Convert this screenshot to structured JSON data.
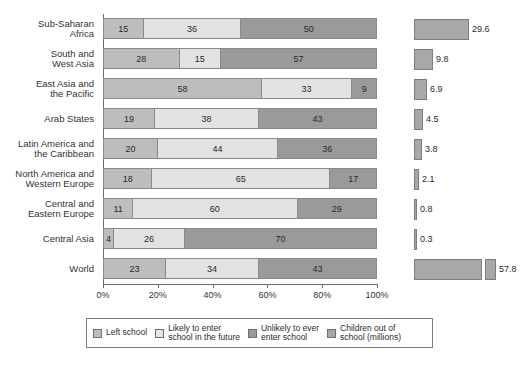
{
  "chart_data": {
    "type": "bar",
    "title": "",
    "xlabel": "",
    "ylabel": "",
    "orientation": "horizontal",
    "stacked": true,
    "stack_mode": "percent",
    "xlim": [
      0,
      100
    ],
    "xticks": [
      0,
      20,
      40,
      60,
      80,
      100
    ],
    "xtick_labels": [
      "0%",
      "20%",
      "40%",
      "60%",
      "80%",
      "100%"
    ],
    "grid": false,
    "legend_position": "bottom",
    "categories": [
      "Sub-Saharan Africa",
      "South and West Asia",
      "East Asia and the Pacific",
      "Arab States",
      "Latin America and the Caribbean",
      "North America and Western Europe",
      "Central and Eastern Europe",
      "Central Asia",
      "World"
    ],
    "series": [
      {
        "name": "Left school",
        "values": [
          15,
          28,
          58,
          19,
          20,
          18,
          11,
          4,
          23
        ]
      },
      {
        "name": "Likely to enter school in the future",
        "values": [
          36,
          15,
          33,
          38,
          44,
          65,
          60,
          26,
          34
        ]
      },
      {
        "name": "Unlikely to ever enter school",
        "values": [
          50,
          57,
          9,
          43,
          36,
          17,
          29,
          70,
          43
        ]
      }
    ],
    "secondary_series": {
      "name": "Children out of school (millions)",
      "values": [
        29.6,
        9.8,
        6.9,
        4.5,
        3.8,
        2.1,
        0.8,
        0.3,
        57.8
      ],
      "broken_axis_rows": [
        "World"
      ]
    },
    "colors": {
      "left_school": "#bdbdbd",
      "likely_to_enter": "#e2e2e2",
      "unlikely_to_enter": "#9a9a9a",
      "children_out_of_school": "#a8a8a8",
      "axis": "#6b6b6b",
      "text": "#2b2b2b"
    }
  },
  "rows": [
    {
      "label_lines": [
        "Sub-Saharan",
        "Africa"
      ],
      "segments": [
        15,
        36,
        50
      ],
      "side_value": "29.6",
      "side_px": 55,
      "side_break": false
    },
    {
      "label_lines": [
        "South and",
        "West Asia"
      ],
      "segments": [
        28,
        15,
        57
      ],
      "side_value": "9.8",
      "side_px": 19,
      "side_break": false
    },
    {
      "label_lines": [
        "East Asia and",
        "the Pacific"
      ],
      "segments": [
        58,
        33,
        9
      ],
      "side_value": "6.9",
      "side_px": 13,
      "side_break": false
    },
    {
      "label_lines": [
        "Arab States"
      ],
      "segments": [
        19,
        38,
        43
      ],
      "side_value": "4.5",
      "side_px": 9,
      "side_break": false
    },
    {
      "label_lines": [
        "Latin America and",
        "the Caribbean"
      ],
      "segments": [
        20,
        44,
        36
      ],
      "side_value": "3.8",
      "side_px": 8,
      "side_break": false
    },
    {
      "label_lines": [
        "North America and",
        "Western Europe"
      ],
      "segments": [
        18,
        65,
        17
      ],
      "side_value": "2.1",
      "side_px": 5,
      "side_break": false
    },
    {
      "label_lines": [
        "Central and",
        "Eastern Europe"
      ],
      "segments": [
        11,
        60,
        29
      ],
      "side_value": "0.8",
      "side_px": 3,
      "side_break": false
    },
    {
      "label_lines": [
        "Central Asia"
      ],
      "segments": [
        4,
        26,
        70
      ],
      "side_value": "0.3",
      "side_px": 3,
      "side_break": false
    },
    {
      "label_lines": [
        "World"
      ],
      "segments": [
        23,
        34,
        43
      ],
      "side_value": "57.8",
      "side_px": 68,
      "side_break": true,
      "side_px2": 11
    }
  ],
  "axis": {
    "tick_labels": [
      "0%",
      "20%",
      "40%",
      "60%",
      "80%",
      "100%"
    ]
  },
  "legend": {
    "items": [
      {
        "swatch": "lg-left",
        "lines": [
          "Left school"
        ]
      },
      {
        "swatch": "lg-likely",
        "lines": [
          "Likely to enter",
          "school in the future"
        ]
      },
      {
        "swatch": "lg-unlikely",
        "lines": [
          "Unlikely to ever",
          "enter school"
        ]
      },
      {
        "swatch": "lg-out",
        "lines": [
          "Children out of",
          "school (millions)"
        ]
      }
    ]
  }
}
